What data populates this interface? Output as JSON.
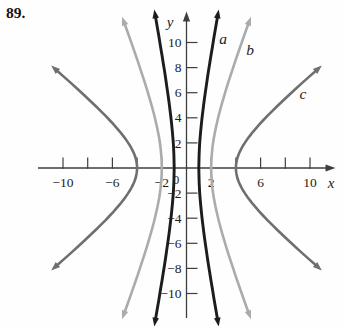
{
  "figure": {
    "number": "89."
  },
  "axes": {
    "x_label": "x",
    "y_label": "y",
    "origin_label": "0",
    "tick_step": 2,
    "x_ticks": [
      -10,
      -8,
      -6,
      -4,
      -2,
      2,
      4,
      6,
      8,
      10
    ],
    "y_ticks": [
      -10,
      -8,
      -6,
      -4,
      -2,
      2,
      4,
      6,
      8,
      10
    ],
    "x_labeled_ticks": [
      {
        "v": -10,
        "t": "−10"
      },
      {
        "v": -6,
        "t": "−6"
      },
      {
        "v": -2,
        "t": "−2"
      },
      {
        "v": 2,
        "t": "2"
      },
      {
        "v": 6,
        "t": "6"
      },
      {
        "v": 10,
        "t": "10"
      }
    ],
    "y_labeled_ticks": [
      {
        "v": 10,
        "t": "10"
      },
      {
        "v": 8,
        "t": "8"
      },
      {
        "v": 6,
        "t": "6"
      },
      {
        "v": 4,
        "t": "4"
      },
      {
        "v": 2,
        "t": "2"
      },
      {
        "v": -2,
        "t": "−2"
      },
      {
        "v": -4,
        "t": "−4"
      },
      {
        "v": -6,
        "t": "−6"
      },
      {
        "v": -8,
        "t": "−8"
      },
      {
        "v": -10,
        "t": "−10"
      }
    ]
  },
  "chart_data": {
    "type": "line",
    "title": "",
    "xlabel": "x",
    "ylabel": "y",
    "xlim": [
      -11.5,
      12
    ],
    "ylim": [
      -12.5,
      12.5
    ],
    "grid": false,
    "legend_position": "labels beside upper-right arms",
    "series": [
      {
        "name": "a",
        "color": "#1c1c1c",
        "shape": "hyperbola opening left-right",
        "equation": "x²/1 − y²/27.5 = 1",
        "a": 1,
        "b": 5.24,
        "t_max": 1.57,
        "vertices": [
          [
            -1,
            0
          ],
          [
            1,
            0
          ]
        ],
        "sample_points_right_branch": [
          [
            1,
            0
          ],
          [
            1.2,
            3.4
          ],
          [
            1.6,
            6.6
          ],
          [
            2.1,
            9.6
          ],
          [
            2.55,
            12.3
          ]
        ]
      },
      {
        "name": "b",
        "color": "#ababab",
        "shape": "hyperbola opening left-right",
        "equation": "x²/4 − y²/25 = 1",
        "a": 2,
        "b": 5.0,
        "t_max": 1.57,
        "vertices": [
          [
            -2,
            0
          ],
          [
            2,
            0
          ]
        ],
        "sample_points_right_branch": [
          [
            2,
            0
          ],
          [
            2.5,
            3.2
          ],
          [
            3.3,
            6.4
          ],
          [
            4.2,
            9.1
          ],
          [
            5.1,
            11.5
          ]
        ]
      },
      {
        "name": "c",
        "color": "#6f6f6f",
        "shape": "hyperbola opening left-right",
        "equation": "x²/16 − y²/10.3 = 1",
        "a": 4,
        "b": 3.2,
        "t_max": 1.62,
        "vertices": [
          [
            -4,
            0
          ],
          [
            4,
            0
          ]
        ],
        "sample_points_right_branch": [
          [
            4,
            0
          ],
          [
            5,
            1.9
          ],
          [
            6.6,
            3.4
          ],
          [
            8.6,
            5.0
          ],
          [
            10.6,
            7.9
          ]
        ]
      }
    ]
  }
}
